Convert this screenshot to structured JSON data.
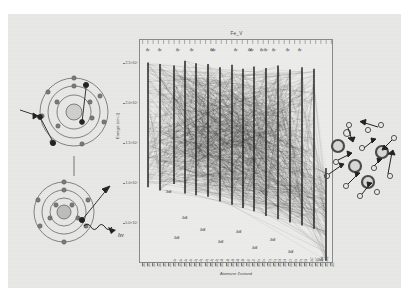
{
  "slide": {
    "background_color": "#e8e8e6",
    "panels": [
      "left-atom-illustration",
      "grotrian-plot",
      "right-plasma-illustration"
    ]
  },
  "chart_data": {
    "type": "scatter",
    "title": "Fe_V",
    "xlabel": "Atomarer Zustand",
    "ylabel": "Energie (cm-1)",
    "ylim": [
      0,
      280000
    ],
    "yticks": [
      50000,
      100000,
      150000,
      200000,
      250000
    ],
    "ytick_labels": [
      "5.0×10⁴",
      "1.0×10⁵",
      "1.5×10⁵",
      "2.0×10⁵",
      "2.5×10⁵"
    ],
    "grid": false,
    "legend": "none",
    "xtick_labels": [
      "3d4",
      "3d4",
      "3d4",
      "3d4",
      "3d4",
      "3d4",
      "3d3 4s",
      "3d3 4s",
      "3d3 4s",
      "3d3 4s",
      "3d3 4p",
      "3d3 4p",
      "3d3 4p",
      "3d3 4p",
      "3d3 4p",
      "3d3 4d",
      "3d3 4d",
      "3d3 4d",
      "3d3 4d",
      "3d3 4d",
      "3d3 4f",
      "3d3 4f",
      "3d3 5s",
      "3d3 5s",
      "3d3 5p",
      "3d3 5p",
      "3d3 5d",
      "3d3 5d",
      "3d3 5f",
      "3d3 6s",
      "3d3 6p",
      "3d3 6d",
      "3d2 4s2",
      "3d2 4s2",
      "3d2 4s4p",
      "3d2 4s4p",
      "3d5"
    ],
    "columns": [
      {
        "label": "4p",
        "x": 8,
        "top": 252000,
        "bottom": 96000
      },
      {
        "label": "4p",
        "x": 20,
        "top": 250000,
        "bottom": 92000
      },
      {
        "label": "4p",
        "x": 34,
        "top": 248000,
        "bottom": 100000
      },
      {
        "label": "4p",
        "x": 45,
        "top": 254000,
        "bottom": 88000
      },
      {
        "label": "4p",
        "x": 56,
        "top": 251000,
        "bottom": 86000
      },
      {
        "label": "4p",
        "x": 68,
        "top": 250000,
        "bottom": 84000
      },
      {
        "label": "4p",
        "x": 80,
        "top": 246000,
        "bottom": 78000
      },
      {
        "label": "4p",
        "x": 92,
        "top": 249000,
        "bottom": 74000
      },
      {
        "label": "4d",
        "x": 103,
        "top": 244000,
        "bottom": 70000
      },
      {
        "label": "4p",
        "x": 114,
        "top": 247000,
        "bottom": 66000
      },
      {
        "label": "4p",
        "x": 126,
        "top": 245000,
        "bottom": 60000
      },
      {
        "label": "4p",
        "x": 138,
        "top": 248000,
        "bottom": 56000
      },
      {
        "label": "4p",
        "x": 150,
        "top": 243000,
        "bottom": 52000
      },
      {
        "label": "4p",
        "x": 162,
        "top": 246000,
        "bottom": 48000
      },
      {
        "label": "4p",
        "x": 174,
        "top": 244000,
        "bottom": 44000
      },
      {
        "label": "3d",
        "x": 186,
        "top": 120000,
        "bottom": 4000
      }
    ],
    "level_labels": [
      {
        "text": "3d4",
        "x": 26,
        "y": 150
      },
      {
        "text": "3d4",
        "x": 42,
        "y": 176
      },
      {
        "text": "3d4",
        "x": 34,
        "y": 196
      },
      {
        "text": "3d4",
        "x": 60,
        "y": 188
      },
      {
        "text": "3d4",
        "x": 78,
        "y": 200
      },
      {
        "text": "3d4",
        "x": 96,
        "y": 190
      },
      {
        "text": "3d4",
        "x": 112,
        "y": 206
      },
      {
        "text": "3d4",
        "x": 130,
        "y": 198
      },
      {
        "text": "3d4",
        "x": 148,
        "y": 210
      },
      {
        "text": "3d5",
        "x": 178,
        "y": 218
      }
    ],
    "top_labels": [
      {
        "text": "4p",
        "x": 6
      },
      {
        "text": "4p",
        "x": 18
      },
      {
        "text": "4p",
        "x": 36
      },
      {
        "text": "4p",
        "x": 50
      },
      {
        "text": "4p",
        "x": 70
      },
      {
        "text": "4p",
        "x": 72
      },
      {
        "text": "4p",
        "x": 94
      },
      {
        "text": "4p",
        "x": 108
      },
      {
        "text": "4p",
        "x": 120
      },
      {
        "text": "4p",
        "x": 132
      },
      {
        "text": "4p",
        "x": 146
      },
      {
        "text": "4p",
        "x": 158
      },
      {
        "text": "4p",
        "x": 110
      },
      {
        "text": "4p",
        "x": 124
      }
    ]
  },
  "left_illustration": {
    "name": "bohr-atom-pair",
    "top_atom": {
      "shells": 3,
      "caption": ""
    },
    "bottom_atom": {
      "shells": 3,
      "photon_label": "hν"
    }
  },
  "right_illustration": {
    "name": "plasma-ion-electron-cloud",
    "ions": 5,
    "electrons": 12
  }
}
